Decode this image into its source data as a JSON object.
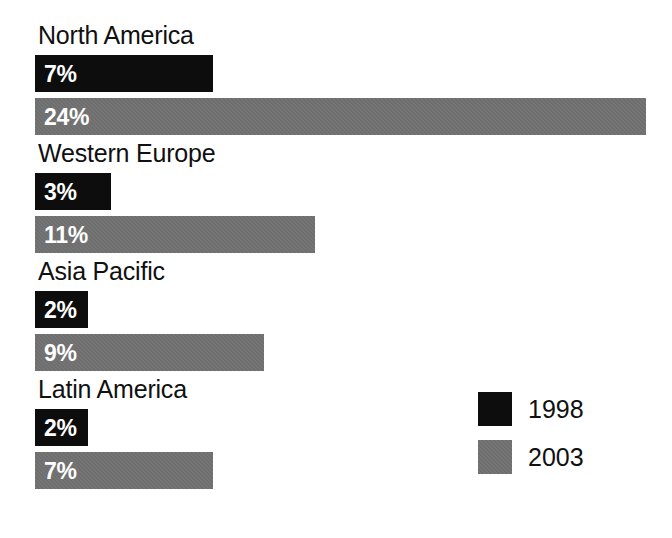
{
  "chart_data": {
    "type": "bar",
    "orientation": "horizontal",
    "title": "",
    "subtitle": "",
    "xlabel": "",
    "ylabel": "",
    "grid": false,
    "axis_visible": false,
    "tick_labels": [],
    "xlim": [
      0,
      25
    ],
    "value_suffix": "%",
    "legend_position": "bottom-right",
    "categories": [
      "North America",
      "Western Europe",
      "Asia Pacific",
      "Latin America"
    ],
    "series": [
      {
        "name": "1998",
        "color": "#0d0d0d",
        "values": [
          7,
          3,
          2,
          2
        ],
        "value_labels": [
          "7%",
          "3%",
          "2%",
          "2%"
        ]
      },
      {
        "name": "2003",
        "color": "#6e6e6e",
        "values": [
          24,
          11,
          9,
          7
        ],
        "value_labels": [
          "24%",
          "11%",
          "9%",
          "7%"
        ]
      }
    ],
    "legend": [
      {
        "label": "1998",
        "color": "#0d0d0d",
        "swatch": "legend-swatch-1998"
      },
      {
        "label": "2003",
        "color": "#6e6e6e",
        "swatch": "legend-swatch-2003"
      }
    ]
  },
  "groups": [
    {
      "label": "North America",
      "bar_1998": {
        "label": "7%",
        "value": 7
      },
      "bar_2003": {
        "label": "24%",
        "value": 24
      }
    },
    {
      "label": "Western Europe",
      "bar_1998": {
        "label": "3%",
        "value": 3
      },
      "bar_2003": {
        "label": "11%",
        "value": 11
      }
    },
    {
      "label": "Asia Pacific",
      "bar_1998": {
        "label": "2%",
        "value": 2
      },
      "bar_2003": {
        "label": "9%",
        "value": 9
      }
    },
    {
      "label": "Latin America",
      "bar_1998": {
        "label": "2%",
        "value": 2
      },
      "bar_2003": {
        "label": "7%",
        "value": 7
      }
    }
  ],
  "legend": {
    "rows": [
      {
        "label": "1998"
      },
      {
        "label": "2003"
      }
    ]
  },
  "layout": {
    "bar_origin_x": 35,
    "px_per_unit": 25.45,
    "min_bar_px": 53,
    "group_top_y": [
      22,
      140,
      258,
      376
    ],
    "label_height": 33,
    "bar_height": 37,
    "bar_gap": 6
  },
  "colors": {
    "series_1998": "#0d0d0d",
    "series_2003": "#6e6e6e",
    "background": "#ffffff",
    "text": "#101010",
    "value_text": "#ffffff"
  }
}
